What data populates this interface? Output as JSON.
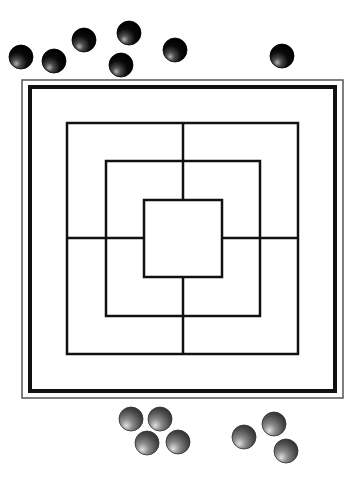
{
  "game": {
    "name": "Nine Men's Morris"
  },
  "colors": {
    "background": "#ffffff",
    "frame": "#555555",
    "line": "#111111",
    "black_piece_light": "#9a9a9a",
    "black_piece_dark": "#000000",
    "gray_piece_light": "#d8d8d8",
    "gray_piece_mid": "#7a7a7a",
    "gray_piece_dark": "#3a3a3a"
  },
  "board": {
    "outer_frame": {
      "x": 22,
      "y": 80,
      "w": 321,
      "h": 318
    },
    "thick_border": {
      "x": 30,
      "y": 87,
      "w": 305,
      "h": 304
    },
    "squares": [
      {
        "name": "outer",
        "x": 67,
        "y": 123,
        "w": 231,
        "h": 231
      },
      {
        "name": "middle",
        "x": 106,
        "y": 161,
        "w": 154,
        "h": 155
      },
      {
        "name": "inner",
        "x": 144,
        "y": 200,
        "w": 78,
        "h": 77
      }
    ],
    "connectors": [
      {
        "x1": 183,
        "y1": 123,
        "x2": 183,
        "y2": 200
      },
      {
        "x1": 183,
        "y1": 277,
        "x2": 183,
        "y2": 354
      },
      {
        "x1": 67,
        "y1": 238,
        "x2": 144,
        "y2": 238
      },
      {
        "x1": 222,
        "y1": 238,
        "x2": 298,
        "y2": 238
      }
    ]
  },
  "pieces": {
    "black": {
      "count": 7,
      "radius": 12,
      "positions": [
        {
          "x": 21,
          "y": 57
        },
        {
          "x": 54,
          "y": 61
        },
        {
          "x": 84,
          "y": 40
        },
        {
          "x": 129,
          "y": 33
        },
        {
          "x": 121,
          "y": 65
        },
        {
          "x": 175,
          "y": 50
        },
        {
          "x": 282,
          "y": 56
        }
      ]
    },
    "gray": {
      "count": 7,
      "radius": 12,
      "positions": [
        {
          "x": 131,
          "y": 419
        },
        {
          "x": 160,
          "y": 419
        },
        {
          "x": 147,
          "y": 443
        },
        {
          "x": 178,
          "y": 442
        },
        {
          "x": 244,
          "y": 437
        },
        {
          "x": 274,
          "y": 424
        },
        {
          "x": 286,
          "y": 451
        }
      ]
    }
  }
}
